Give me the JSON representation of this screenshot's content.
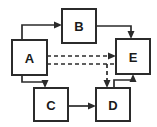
{
  "diagram": {
    "type": "block-diagram",
    "title": "",
    "width": 157,
    "height": 127,
    "background_color": "#ffffff",
    "stroke_color": "#2b2b2b",
    "node_fill_color": "#ffffff",
    "nodes": [
      {
        "id": "A",
        "label": "A",
        "x": 12,
        "y": 40,
        "w": 35,
        "h": 35,
        "cx": 29.5,
        "cy": 57.5
      },
      {
        "id": "B",
        "label": "B",
        "x": 62,
        "y": 9,
        "w": 34,
        "h": 34,
        "cx": 79,
        "cy": 26
      },
      {
        "id": "C",
        "label": "C",
        "x": 34,
        "y": 88,
        "w": 34,
        "h": 33,
        "cx": 51,
        "cy": 104.5
      },
      {
        "id": "D",
        "label": "D",
        "x": 96,
        "y": 88,
        "w": 34,
        "h": 33,
        "cx": 113,
        "cy": 104.5
      },
      {
        "id": "E",
        "label": "E",
        "x": 116,
        "y": 39,
        "w": 34,
        "h": 35,
        "cx": 133,
        "cy": 56.5
      }
    ],
    "edges": [
      {
        "id": "A-to-B",
        "from": "A",
        "to": "B",
        "style": "solid",
        "arrow": "to",
        "label": ""
      },
      {
        "id": "B-to-E",
        "from": "B",
        "to": "E",
        "style": "solid",
        "arrow": "to",
        "label": ""
      },
      {
        "id": "A-to-E-upper",
        "from": "A",
        "to": "E",
        "style": "dashed",
        "arrow": "to",
        "label": ""
      },
      {
        "id": "A-to-E-lower",
        "from": "A",
        "to": "E",
        "style": "dashed",
        "arrow": "none",
        "label": ""
      },
      {
        "id": "A-to-D-dashed",
        "from": "A",
        "to": "D",
        "style": "dashed",
        "arrow": "to",
        "label": ""
      },
      {
        "id": "A-to-C",
        "from": "A",
        "to": "C",
        "style": "solid",
        "arrow": "to",
        "label": ""
      },
      {
        "id": "C-to-D",
        "from": "C",
        "to": "D",
        "style": "solid",
        "arrow": "to",
        "label": ""
      },
      {
        "id": "D-to-E",
        "from": "D",
        "to": "E",
        "style": "solid",
        "arrow": "to",
        "label": ""
      }
    ]
  }
}
